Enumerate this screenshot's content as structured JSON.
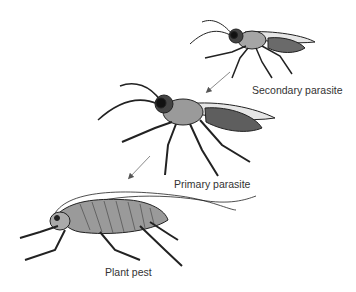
{
  "diagram": {
    "type": "food-chain / parasitism illustration",
    "organisms": [
      {
        "id": "secondary",
        "label": "Secondary parasite"
      },
      {
        "id": "primary",
        "label": "Primary parasite"
      },
      {
        "id": "pest",
        "label": "Plant pest"
      }
    ],
    "arrows": [
      {
        "from": "secondary",
        "to": "primary"
      },
      {
        "from": "primary",
        "to": "pest"
      }
    ],
    "colors": {
      "outline": "#222222",
      "body_fill": "#9a9a9a",
      "light_fill": "#cfcfcf",
      "dark_fill": "#4a4a4a",
      "arrow": "#8a8a8a",
      "text": "#333333"
    }
  }
}
